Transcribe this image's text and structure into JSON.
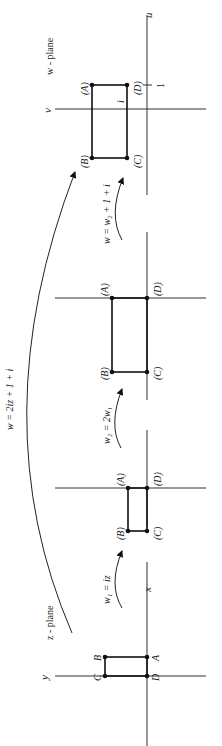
{
  "diagram": {
    "title_map": "w = 2iz + 1 + i",
    "orientation": "rotated 90deg counter-clockwise (text reads bottom-to-top)",
    "planes": [
      {
        "name": "z - plane",
        "axis_labels": {
          "horizontal": "x",
          "vertical": "y"
        },
        "corners": [
          "A",
          "B",
          "C",
          "D"
        ],
        "corner_style": "plain"
      },
      {
        "name": "w1 plane",
        "corners": [
          "(A)",
          "(B)",
          "(C)",
          "(D)"
        ],
        "corner_style": "parenthesized"
      },
      {
        "name": "w2 plane",
        "corners": [
          "(A)",
          "(B)",
          "(C)",
          "(D)"
        ],
        "corner_style": "parenthesized"
      },
      {
        "name": "w - plane",
        "axis_labels": {
          "horizontal": "u",
          "vertical": "v"
        },
        "tick_labels": {
          "real": "1",
          "imag": "i"
        },
        "corners": [
          "(A)",
          "(B)",
          "(C)",
          "(D)"
        ],
        "corner_style": "parenthesized"
      }
    ],
    "transforms": [
      {
        "label": "w₁ = iz",
        "from": "z - plane",
        "to": "w1 plane"
      },
      {
        "label": "w₂ = 2w₁",
        "from": "w1 plane",
        "to": "w2 plane"
      },
      {
        "label": "w = w₂ + 1 + i",
        "from": "w2 plane",
        "to": "w - plane"
      }
    ],
    "overall_transform": {
      "label": "w = 2iz + 1 + i",
      "from": "z - plane",
      "to": "w - plane"
    },
    "text": {
      "zplane": "z - plane",
      "wplane": "w - plane",
      "x": "x",
      "y": "y",
      "u": "u",
      "v": "v",
      "one": "1",
      "i": "i",
      "t1": "w₁ = iz",
      "t2": "w₂ = 2w₁",
      "t3": "w = w₂ + 1 + i",
      "overall": "w = 2iz + 1 + i",
      "zA": "A",
      "zB": "B",
      "zC": "C",
      "zD": "D",
      "pA": "(A)",
      "pB": "(B)",
      "pC": "(C)",
      "pD": "(D)"
    }
  }
}
